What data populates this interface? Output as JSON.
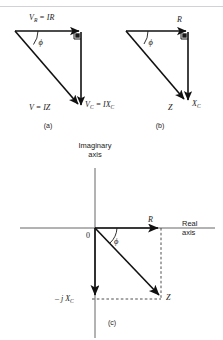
{
  "figure": {
    "panels": [
      {
        "id": "a",
        "caption": "(a)",
        "type": "phasor-triangle",
        "labels": {
          "top": "V",
          "top_sub": "R",
          "top_rest": " = IR",
          "angle": "ϕ",
          "hyp": "V = IZ",
          "vert": "V",
          "vert_sub": "C",
          "vert_rest": " = IX",
          "vert_rest_sub": "C"
        }
      },
      {
        "id": "b",
        "caption": "(b)",
        "type": "impedance-triangle",
        "labels": {
          "top": "R",
          "angle": "ϕ",
          "hyp": "Z",
          "vert": "X",
          "vert_sub": "C"
        }
      },
      {
        "id": "c",
        "caption": "(c)",
        "type": "complex-plane",
        "labels": {
          "imaginary_axis_line1": "Imaginary",
          "imaginary_axis_line2": "axis",
          "real_axis_line1": "Real",
          "real_axis_line2": "axis",
          "origin": "0",
          "real_component": "R",
          "imag_component_prefix": "– j X",
          "imag_component_sub": "C",
          "resultant": "Z",
          "angle": "ϕ"
        }
      }
    ]
  },
  "colors": {
    "ink": "#1a1a1a",
    "axis": "#555555",
    "dashed": "#3a3a3a",
    "rule": "#d0d2d5",
    "background": "#ffffff"
  }
}
